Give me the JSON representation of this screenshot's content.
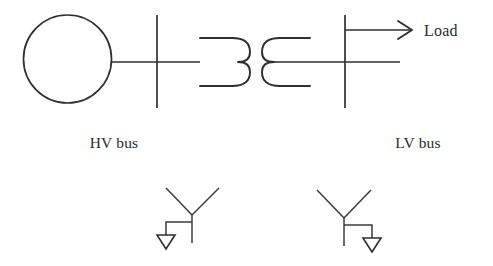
{
  "diagram": {
    "kind": "single-line-diagram",
    "title": "",
    "colors": {
      "stroke": "#2e2e33",
      "background": "#ffffff",
      "text": "#2b2b30"
    },
    "labels": {
      "load": "Load",
      "hv_bus": "HV bus",
      "lv_bus": "LV bus"
    },
    "components": {
      "generator": {
        "name": "generator",
        "shape": "circle",
        "cx": 67.5,
        "cy": 59,
        "r": 44
      },
      "hv_bus": {
        "name": "hv-bus",
        "orientation": "vertical",
        "x": 157,
        "y_top": 15,
        "y_bottom": 108
      },
      "lv_bus": {
        "name": "lv-bus",
        "orientation": "vertical",
        "x": 345,
        "y_top": 15,
        "y_bottom": 108
      },
      "transformer": {
        "name": "two-winding-transformer",
        "primary_winding": "open-left-double-bump",
        "secondary_winding": "open-right-double-bump",
        "center_y": 62
      },
      "load_arrow": {
        "name": "load-arrow",
        "from_x": 345,
        "to_x": 412,
        "y": 30,
        "head_style": "open-v"
      },
      "wye_left": {
        "name": "wye-grounded-left",
        "center_x": 192,
        "center_y": 215,
        "ground_side": "left"
      },
      "wye_right": {
        "name": "wye-grounded-right",
        "center_x": 344,
        "center_y": 218,
        "ground_side": "right"
      }
    }
  }
}
